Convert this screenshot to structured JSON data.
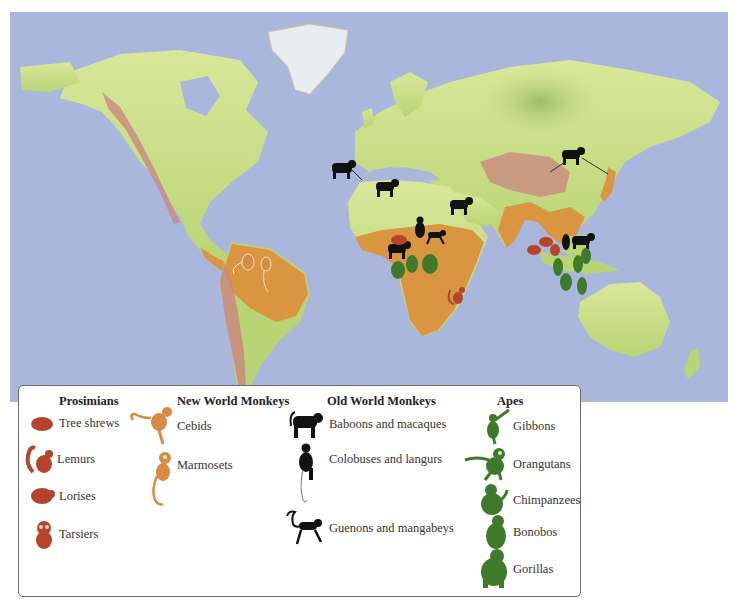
{
  "colors": {
    "ocean": "#aab6dc",
    "land_temperate": "#c6dc86",
    "land_tropical": "#d9953f",
    "mountains": "#c98a80",
    "ice": "#e6eef0",
    "prosimian": "#b6442c",
    "new_world_monkey": "#d88b45",
    "old_world_monkey": "#111111",
    "ape": "#3f7a2a"
  },
  "legend": {
    "columns": [
      {
        "title": "Prosimians",
        "items": [
          {
            "label": "Tree shrews",
            "icon": "tree-shrew-icon"
          },
          {
            "label": "Lemurs",
            "icon": "lemur-icon"
          },
          {
            "label": "Lorises",
            "icon": "loris-icon"
          },
          {
            "label": "Tarsiers",
            "icon": "tarsier-icon"
          }
        ]
      },
      {
        "title": "New World Monkeys",
        "items": [
          {
            "label": "Cebids",
            "icon": "cebid-icon"
          },
          {
            "label": "Marmosets",
            "icon": "marmoset-icon"
          }
        ]
      },
      {
        "title": "Old World Monkeys",
        "items": [
          {
            "label": "Baboons and macaques",
            "icon": "baboon-icon"
          },
          {
            "label": "Colobuses and langurs",
            "icon": "colobus-icon"
          },
          {
            "label": "Guenons and mangabeys",
            "icon": "guenon-icon"
          }
        ]
      },
      {
        "title": "Apes",
        "items": [
          {
            "label": "Gibbons",
            "icon": "gibbon-icon"
          },
          {
            "label": "Orangutans",
            "icon": "orangutan-icon"
          },
          {
            "label": "Chimpanzees",
            "icon": "chimpanzee-icon"
          },
          {
            "label": "Bonobos",
            "icon": "bonobo-icon"
          },
          {
            "label": "Gorillas",
            "icon": "gorilla-icon"
          }
        ]
      }
    ]
  },
  "map_markers": [
    {
      "group": "old_world_monkey",
      "species": "Baboons and macaques",
      "region": "North Africa (Morocco)"
    },
    {
      "group": "old_world_monkey",
      "species": "Baboons and macaques",
      "region": "Sahara"
    },
    {
      "group": "old_world_monkey",
      "species": "Baboons and macaques",
      "region": "Arabian Peninsula"
    },
    {
      "group": "old_world_monkey",
      "species": "Baboons and macaques",
      "region": "China / Japan"
    },
    {
      "group": "old_world_monkey",
      "species": "Colobuses and langurs",
      "region": "East Africa"
    },
    {
      "group": "old_world_monkey",
      "species": "Guenons and mangabeys",
      "region": "East Africa"
    },
    {
      "group": "old_world_monkey",
      "species": "Baboons and macaques",
      "region": "Central Africa"
    },
    {
      "group": "prosimian",
      "species": "Lorises",
      "region": "Central Africa"
    },
    {
      "group": "ape",
      "species": "Chimpanzees",
      "region": "Central Africa"
    },
    {
      "group": "ape",
      "species": "Bonobos",
      "region": "Central Africa"
    },
    {
      "group": "ape",
      "species": "Gorillas",
      "region": "Central Africa"
    },
    {
      "group": "prosimian",
      "species": "Lemurs",
      "region": "Madagascar"
    },
    {
      "group": "new_world_monkey",
      "species": "Cebids",
      "region": "Amazon Basin"
    },
    {
      "group": "new_world_monkey",
      "species": "Marmosets",
      "region": "Amazon Basin"
    },
    {
      "group": "prosimian",
      "species": "Tree shrews",
      "region": "Southeast Asia"
    },
    {
      "group": "prosimian",
      "species": "Lorises",
      "region": "Southeast Asia"
    },
    {
      "group": "prosimian",
      "species": "Tarsiers",
      "region": "Southeast Asia"
    },
    {
      "group": "old_world_monkey",
      "species": "Colobuses and langurs",
      "region": "Southeast Asia"
    },
    {
      "group": "old_world_monkey",
      "species": "Baboons and macaques",
      "region": "Southeast Asia"
    },
    {
      "group": "ape",
      "species": "Gibbons",
      "region": "Southeast Asia"
    },
    {
      "group": "ape",
      "species": "Orangutans",
      "region": "Borneo / Sumatra"
    }
  ]
}
